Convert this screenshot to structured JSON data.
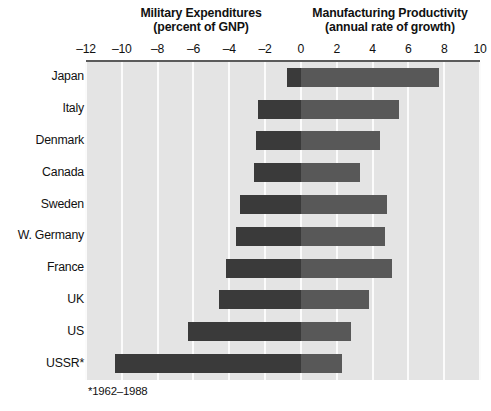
{
  "headers": {
    "military_line1": "Military Expenditures",
    "military_line2": "(percent of GNP)",
    "productivity_line1": "Manufacturing Productivity",
    "productivity_line2": "(annual rate of growth)"
  },
  "footnote": "*1962–1988",
  "axis": {
    "ticks": [
      "–12",
      "–10",
      "–8",
      "–6",
      "–4",
      "–2",
      "0",
      "2",
      "4",
      "6",
      "8",
      "10"
    ]
  },
  "colors": {
    "panel_background": "#e4e4e4",
    "gridline": "#fbfbfb",
    "military_bar": "#3a3a3a",
    "productivity_bar": "#585858",
    "axis_rule": "#5b5b5b",
    "text": "#111111"
  },
  "chart_data": {
    "type": "bar",
    "orientation": "horizontal",
    "layout": "diverging",
    "xlabel": "",
    "ylabel": "",
    "xlim": [
      -12,
      10
    ],
    "xticks": [
      -12,
      -10,
      -8,
      -6,
      -4,
      -2,
      0,
      2,
      4,
      6,
      8,
      10
    ],
    "grid": "vertical",
    "legend": "none",
    "categories": [
      "Japan",
      "Italy",
      "Denmark",
      "Canada",
      "Sweden",
      "W. Germany",
      "France",
      "UK",
      "US",
      "USSR*"
    ],
    "series": [
      {
        "name": "Military Expenditures (percent of GNP)",
        "note": "plotted to the left of zero as negative values",
        "values": [
          -0.8,
          -2.4,
          -2.5,
          -2.6,
          -3.4,
          -3.6,
          -4.2,
          -4.6,
          -6.3,
          -10.4
        ]
      },
      {
        "name": "Manufacturing Productivity (annual rate of growth)",
        "values": [
          7.7,
          5.5,
          4.4,
          3.3,
          4.8,
          4.7,
          5.1,
          3.8,
          2.8,
          2.3
        ]
      }
    ],
    "annotations": [
      "*1962–1988"
    ]
  }
}
